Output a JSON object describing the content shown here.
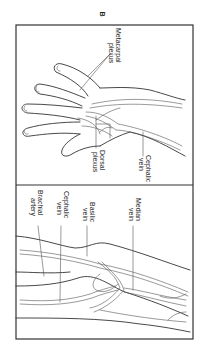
{
  "figure": {
    "panel_letter": "B",
    "orientation": "rotated-90",
    "panels": [
      {
        "name": "hand-dorsum",
        "labels": [
          {
            "id": "metacarpal",
            "line1": "Metacarpal",
            "line2": "plexus"
          },
          {
            "id": "dorsal",
            "line1": "Dorsal",
            "line2": "plexus"
          },
          {
            "id": "cephalic",
            "line1": "Cephalic",
            "line2": "vein"
          }
        ]
      },
      {
        "name": "forearm-antecubital",
        "labels": [
          {
            "id": "brachial",
            "line1": "Brachial",
            "line2": "artery"
          },
          {
            "id": "cephalic",
            "line1": "Cephalic",
            "line2": "vein"
          },
          {
            "id": "basilic",
            "line1": "Basilic",
            "line2": "vein"
          },
          {
            "id": "median",
            "line1": "Median",
            "line2": "vein"
          }
        ]
      }
    ]
  }
}
